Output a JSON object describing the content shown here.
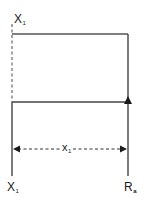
{
  "diagram": {
    "type": "beam-span-schematic",
    "colors": {
      "line": "#555555",
      "arrow": "#1a1a1a",
      "text": "#1a1a1a",
      "background": "#ffffff"
    },
    "labels": {
      "top_left": {
        "main": "X",
        "sub": "1"
      },
      "span": {
        "main": "x",
        "sub": "1"
      },
      "bottom_left": {
        "main": "X",
        "sub": "1"
      },
      "bottom_right": {
        "main": "R",
        "sub": "a"
      }
    },
    "elements": [
      {
        "kind": "dashed-vertical",
        "x": 12,
        "y1": 24,
        "y2": 102
      },
      {
        "kind": "solid-horizontal",
        "y": 34,
        "x1": 12,
        "x2": 128
      },
      {
        "kind": "solid-vertical",
        "x": 128,
        "y1": 34,
        "y2": 176
      },
      {
        "kind": "solid-horizontal",
        "y": 102,
        "x1": 12,
        "x2": 128
      },
      {
        "kind": "solid-vertical",
        "x": 12,
        "y1": 102,
        "y2": 176
      },
      {
        "kind": "arrow-up",
        "x": 128,
        "y": 102
      },
      {
        "kind": "dashed-double-arrow",
        "y": 149,
        "x1": 12,
        "x2": 128
      }
    ]
  }
}
